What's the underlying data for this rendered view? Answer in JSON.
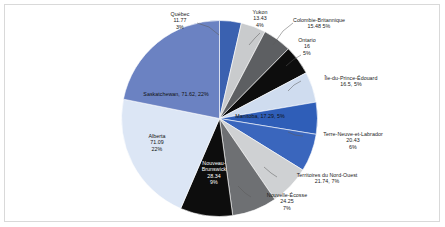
{
  "chart_data": {
    "type": "pie",
    "title": "",
    "subtitle": "",
    "xlabel": "",
    "ylabel": "",
    "legend_position": "none",
    "grid": false,
    "categories": [
      "Québec",
      "Yukon",
      "Colombie-Britannique",
      "Ontario",
      "Île-du-Prince-Édouard",
      "Manitoba",
      "Terre-Neuve-et-Labrador",
      "Territoires du Nord-Ouest",
      "Nouvelle-Écosse",
      "Nouveau-Brunswick",
      "Alberta",
      "Saskatchewan"
    ],
    "values": [
      11.77,
      13.43,
      15.48,
      16,
      16.5,
      17.29,
      20.43,
      21.74,
      24.25,
      28.34,
      71.09,
      71.62
    ],
    "percentages": [
      3,
      4,
      5,
      5,
      5,
      5,
      6,
      7,
      7,
      9,
      22,
      22
    ],
    "colors": [
      "#3a61b0",
      "#c9cbcd",
      "#5d5f62",
      "#0d0d0d",
      "#cfdcef",
      "#2f5eb8",
      "#3a66bd",
      "#cfd1d3",
      "#6e7073",
      "#0d0d0d",
      "#dce6f5",
      "#6b82c2"
    ],
    "slices": [
      {
        "label": "Québec",
        "value": 11.77,
        "percent": 3,
        "color": "#3a61b0"
      },
      {
        "label": "Yukon",
        "value": 13.43,
        "percent": 4,
        "color": "#c9cbcd"
      },
      {
        "label": "Colombie-Britannique",
        "value": 15.48,
        "percent": 5,
        "color": "#5d5f62"
      },
      {
        "label": "Ontario",
        "value": 16,
        "percent": 5,
        "color": "#0d0d0d"
      },
      {
        "label": "Île-du-Prince-Édouard",
        "value": 16.5,
        "percent": 5,
        "color": "#cfdcef"
      },
      {
        "label": "Manitoba",
        "value": 17.29,
        "percent": 5,
        "color": "#2f5eb8"
      },
      {
        "label": "Terre-Neuve-et-Labrador",
        "value": 20.43,
        "percent": 6,
        "color": "#3a66bd"
      },
      {
        "label": "Territoires du Nord-Ouest",
        "value": 21.74,
        "percent": 7,
        "color": "#cfd1d3"
      },
      {
        "label": "Nouvelle-Écosse",
        "value": 24.25,
        "percent": 7,
        "color": "#6e7073"
      },
      {
        "label": "Nouveau-Brunswick",
        "value": 28.34,
        "percent": 9,
        "color": "#0d0d0d"
      },
      {
        "label": "Alberta",
        "value": 71.09,
        "percent": 22,
        "color": "#dce6f5"
      },
      {
        "label": "Saskatchewan",
        "value": 71.62,
        "percent": 22,
        "color": "#6b82c2"
      }
    ]
  },
  "labels": {
    "quebec": {
      "line1": "Québec",
      "line2": "11.77",
      "line3": "3%"
    },
    "yukon": {
      "line1": "Yukon",
      "line2": "13.43",
      "line3": "4%"
    },
    "colombie_britannique": {
      "line1": "Colombie-Britannique",
      "line2": "15.48   5%"
    },
    "ontario": {
      "line1": "Ontario",
      "line2": "16",
      "line3": "5%"
    },
    "ile_du_prince_edouard": {
      "line1": "Île-du-Prince-Édouard",
      "line2": "16.5, 5%"
    },
    "manitoba": {
      "line1": "Manitoba, 17.29, 5%"
    },
    "terre_neuve_et_labrador": {
      "line1": "Terre-Neuve-et-Labrador",
      "line2": "20.43",
      "line3": "6%"
    },
    "territoires_du_nord_ouest": {
      "line1": "Territoires du Nord-Ouest",
      "line2": "21.74, 7%"
    },
    "nouvelle_ecosse": {
      "line1": "Nouvelle-Écosse",
      "line2": "24.25",
      "line3": "7%"
    },
    "nouveau_brunswick": {
      "line1": "Nouveau-",
      "line2": "Brunswick",
      "line3": "28.34",
      "line4": "9%"
    },
    "alberta": {
      "line1": "Alberta",
      "line2": "71.09",
      "line3": "22%"
    },
    "saskatchewan": {
      "line1": "Saskatchewan, 71.62, 22%"
    }
  }
}
